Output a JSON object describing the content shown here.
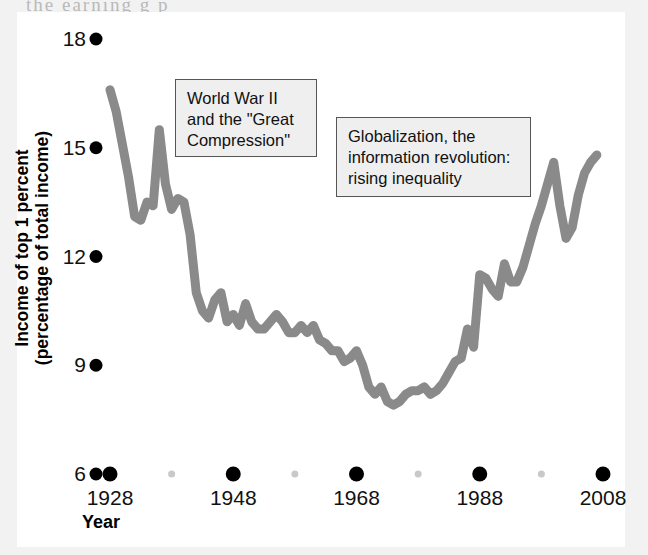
{
  "page": {
    "cropped_text_above": "the  earning  g        p"
  },
  "figure": {
    "background_color": "#ffffff",
    "panel_color": "#ffffff"
  },
  "annotations": [
    {
      "name": "ww2-great-compression",
      "lines": [
        "World War II",
        "and the \"Great",
        "Compression\""
      ],
      "fill": "#efefef",
      "border": "#555555"
    },
    {
      "name": "globalization-inequality",
      "lines": [
        "Globalization, the",
        "information revolution:",
        "rising inequality"
      ],
      "fill": "#efefef",
      "border": "#555555"
    }
  ],
  "chart_data": {
    "type": "line",
    "title": "",
    "xlabel": "Year",
    "ylabel": "Income of top 1 percent (percentage of total income)",
    "ylabel_lines": [
      "Income of top 1 percent",
      "(percentage of total income)"
    ],
    "xlim": [
      1928,
      2008
    ],
    "ylim": [
      6,
      18
    ],
    "grid": false,
    "legend": "none",
    "line_color": "#8a8a8a",
    "marker_color": "#000000",
    "minor_marker_color": "#c9c9c9",
    "y_ticks": [
      6,
      9,
      12,
      15,
      18
    ],
    "y_tick_labels": [
      "6",
      "9",
      "12",
      "15",
      "18"
    ],
    "x_ticks": [
      1928,
      1948,
      1968,
      1988,
      2008
    ],
    "x_tick_labels": [
      "1928",
      "1948",
      "1968",
      "1988",
      "2008"
    ],
    "x_minor_ticks": [
      1938,
      1958,
      1978,
      1998
    ],
    "series": [
      {
        "name": "Income share of top 1 percent",
        "x": [
          1928,
          1929,
          1930,
          1931,
          1932,
          1933,
          1934,
          1935,
          1936,
          1937,
          1938,
          1939,
          1940,
          1941,
          1942,
          1943,
          1944,
          1945,
          1946,
          1947,
          1948,
          1949,
          1950,
          1951,
          1952,
          1953,
          1954,
          1955,
          1956,
          1957,
          1958,
          1959,
          1960,
          1961,
          1962,
          1963,
          1964,
          1965,
          1966,
          1967,
          1968,
          1969,
          1970,
          1971,
          1972,
          1973,
          1974,
          1975,
          1976,
          1977,
          1978,
          1979,
          1980,
          1981,
          1982,
          1983,
          1984,
          1985,
          1986,
          1987,
          1988,
          1989,
          1990,
          1991,
          1992,
          1993,
          1994,
          1995,
          1996,
          1997,
          1998,
          1999,
          2000,
          2001,
          2002,
          2003,
          2004,
          2005,
          2006,
          2007
        ],
        "y": [
          16.6,
          16.0,
          15.1,
          14.2,
          13.1,
          13.0,
          13.5,
          13.4,
          15.5,
          14.0,
          13.3,
          13.6,
          13.5,
          12.6,
          11.0,
          10.5,
          10.3,
          10.8,
          11.0,
          10.2,
          10.4,
          10.1,
          10.7,
          10.2,
          10.0,
          10.0,
          10.2,
          10.4,
          10.2,
          9.9,
          9.9,
          10.1,
          9.9,
          10.1,
          9.7,
          9.6,
          9.4,
          9.4,
          9.1,
          9.2,
          9.4,
          9.0,
          8.4,
          8.2,
          8.4,
          8.0,
          7.9,
          8.0,
          8.2,
          8.3,
          8.3,
          8.4,
          8.2,
          8.3,
          8.5,
          8.8,
          9.1,
          9.2,
          10.0,
          9.5,
          11.5,
          11.4,
          11.1,
          10.9,
          11.8,
          11.3,
          11.3,
          11.7,
          12.3,
          12.9,
          13.4,
          14.0,
          14.6,
          13.4,
          12.5,
          12.8,
          13.7,
          14.3,
          14.6,
          14.8
        ]
      }
    ]
  }
}
